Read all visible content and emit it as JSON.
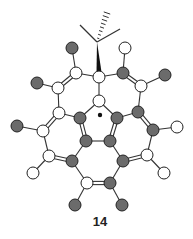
{
  "compound_label": "14",
  "colors": {
    "dark_atom": "#6b6b6b",
    "light_atom": "#ffffff",
    "bond": "#333333"
  },
  "atoms": [
    {
      "id": "c1",
      "x": 99,
      "y": 77,
      "type": "light"
    },
    {
      "id": "c2",
      "x": 99,
      "y": 101,
      "type": "light"
    },
    {
      "id": "c3",
      "x": 76,
      "y": 73,
      "type": "light"
    },
    {
      "id": "o1",
      "x": 72,
      "y": 48,
      "type": "dark"
    },
    {
      "id": "c4",
      "x": 58,
      "y": 88,
      "type": "light"
    },
    {
      "id": "o2",
      "x": 37,
      "y": 83,
      "type": "dark"
    },
    {
      "id": "c5",
      "x": 59,
      "y": 113,
      "type": "light"
    },
    {
      "id": "c6",
      "x": 43,
      "y": 131,
      "type": "light"
    },
    {
      "id": "o3",
      "x": 17,
      "y": 126,
      "type": "dark"
    },
    {
      "id": "c7",
      "x": 80,
      "y": 118,
      "type": "dark"
    },
    {
      "id": "c8",
      "x": 86,
      "y": 141,
      "type": "dark"
    },
    {
      "id": "c9",
      "x": 49,
      "y": 156,
      "type": "light"
    },
    {
      "id": "h1",
      "x": 33,
      "y": 173,
      "type": "light"
    },
    {
      "id": "c10",
      "x": 72,
      "y": 161,
      "type": "dark"
    },
    {
      "id": "c11",
      "x": 87,
      "y": 183,
      "type": "light"
    },
    {
      "id": "o4",
      "x": 75,
      "y": 205,
      "type": "dark"
    },
    {
      "id": "c12",
      "x": 123,
      "y": 73,
      "type": "dark"
    },
    {
      "id": "h2",
      "x": 125,
      "y": 48,
      "type": "light"
    },
    {
      "id": "c13",
      "x": 141,
      "y": 86,
      "type": "light"
    },
    {
      "id": "o5",
      "x": 165,
      "y": 75,
      "type": "dark"
    },
    {
      "id": "c14",
      "x": 138,
      "y": 112,
      "type": "dark"
    },
    {
      "id": "c15",
      "x": 153,
      "y": 130,
      "type": "dark"
    },
    {
      "id": "h3",
      "x": 177,
      "y": 127,
      "type": "light"
    },
    {
      "id": "c16",
      "x": 117,
      "y": 118,
      "type": "dark"
    },
    {
      "id": "c17",
      "x": 110,
      "y": 141,
      "type": "dark"
    },
    {
      "id": "c18",
      "x": 147,
      "y": 155,
      "type": "light"
    },
    {
      "id": "h4",
      "x": 164,
      "y": 173,
      "type": "light"
    },
    {
      "id": "c19",
      "x": 123,
      "y": 161,
      "type": "dark"
    },
    {
      "id": "c20",
      "x": 110,
      "y": 183,
      "type": "dark"
    },
    {
      "id": "o6",
      "x": 122,
      "y": 205,
      "type": "dark"
    }
  ],
  "bonds": [
    {
      "a": "c1",
      "b": "c2",
      "order": 1
    },
    {
      "a": "c1",
      "b": "c3",
      "order": 1
    },
    {
      "a": "c1",
      "b": "c12",
      "order": 1
    },
    {
      "a": "c3",
      "b": "o1",
      "order": 1
    },
    {
      "a": "c3",
      "b": "c4",
      "order": 2
    },
    {
      "a": "c4",
      "b": "o2",
      "order": 1
    },
    {
      "a": "c4",
      "b": "c5",
      "order": 1
    },
    {
      "a": "c5",
      "b": "c6",
      "order": 2
    },
    {
      "a": "c5",
      "b": "c7",
      "order": 1
    },
    {
      "a": "c6",
      "b": "o3",
      "order": 1
    },
    {
      "a": "c6",
      "b": "c9",
      "order": 1
    },
    {
      "a": "c2",
      "b": "c7",
      "order": 1
    },
    {
      "a": "c2",
      "b": "c16",
      "order": 1
    },
    {
      "a": "c7",
      "b": "c8",
      "order": 2
    },
    {
      "a": "c8",
      "b": "c17",
      "order": 1
    },
    {
      "a": "c8",
      "b": "c10",
      "order": 1
    },
    {
      "a": "c9",
      "b": "c10",
      "order": 2
    },
    {
      "a": "c9",
      "b": "h1",
      "order": 1
    },
    {
      "a": "c10",
      "b": "c11",
      "order": 1
    },
    {
      "a": "c11",
      "b": "c20",
      "order": 2
    },
    {
      "a": "c11",
      "b": "o4",
      "order": 1
    },
    {
      "a": "c12",
      "b": "h2",
      "order": 1
    },
    {
      "a": "c12",
      "b": "c13",
      "order": 2
    },
    {
      "a": "c13",
      "b": "o5",
      "order": 1
    },
    {
      "a": "c13",
      "b": "c14",
      "order": 1
    },
    {
      "a": "c14",
      "b": "c15",
      "order": 2
    },
    {
      "a": "c14",
      "b": "c16",
      "order": 1
    },
    {
      "a": "c15",
      "b": "h3",
      "order": 1
    },
    {
      "a": "c15",
      "b": "c18",
      "order": 1
    },
    {
      "a": "c16",
      "b": "c17",
      "order": 2
    },
    {
      "a": "c17",
      "b": "c19",
      "order": 1
    },
    {
      "a": "c18",
      "b": "c19",
      "order": 2
    },
    {
      "a": "c18",
      "b": "h4",
      "order": 1
    },
    {
      "a": "c19",
      "b": "c20",
      "order": 1
    },
    {
      "a": "c20",
      "b": "o6",
      "order": 1
    }
  ],
  "tbutyl": {
    "center": {
      "x": 97,
      "y": 42
    },
    "arms": [
      {
        "x": 80,
        "y": 25
      },
      {
        "x": 120,
        "y": 29
      }
    ],
    "hashed_arm": {
      "x": 107,
      "y": 13
    },
    "wedge_to": "c1"
  },
  "radical_dot": {
    "x": 100,
    "y": 115
  },
  "label_pos": {
    "x": 100,
    "y": 221
  }
}
